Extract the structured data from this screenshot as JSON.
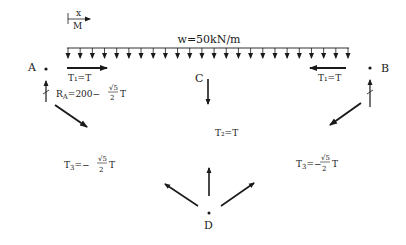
{
  "diagram": {
    "sign_convention": {
      "top": "x",
      "bottom": "M"
    },
    "load": {
      "label": "w=50kN/m",
      "arrow_count": 24
    },
    "points": {
      "A": "A",
      "B": "B",
      "C": "C",
      "D": "D"
    },
    "forces": {
      "T1_left": "T₁=T",
      "T1_right": "T₁=T",
      "T2": "T₂=T",
      "RA_prefix": "R",
      "RA_sub": "A",
      "RA_expr": "=200−",
      "T3_left_prefix": "T",
      "T3_left_sub": "3",
      "T3_left_expr": "=−",
      "T3_right_prefix": "T",
      "T3_right_sub": "3",
      "T3_right_expr": "=−",
      "frac_num": "√5",
      "frac_den": "2",
      "frac_suffix": "T"
    },
    "colors": {
      "ink": "#1a1a1a",
      "background": "#ffffff"
    }
  }
}
